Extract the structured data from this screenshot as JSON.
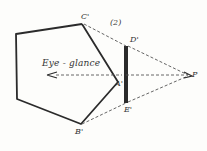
{
  "diagram": {
    "figure_number": "(2)",
    "arrow_label": "Eye - glance",
    "points": {
      "A": "A'",
      "B": "B'",
      "C": "C'",
      "D": "D'",
      "E": "E'",
      "P": "P"
    },
    "colors": {
      "ink": "#2b2b2b",
      "dashed": "#555555",
      "background": "#fdfdfb"
    }
  }
}
